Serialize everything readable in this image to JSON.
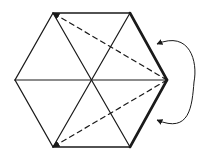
{
  "diagram": {
    "stroke_color": "#1a1a1a",
    "background": "#ffffff",
    "center": {
      "x": 91,
      "y": 80
    },
    "vertices": {
      "top_left": {
        "x": 53,
        "y": 13
      },
      "top_right": {
        "x": 130,
        "y": 13
      },
      "right": {
        "x": 167,
        "y": 80
      },
      "bottom_right": {
        "x": 130,
        "y": 147
      },
      "bottom_left": {
        "x": 53,
        "y": 147
      },
      "left": {
        "x": 15,
        "y": 80
      }
    },
    "edges": [
      {
        "from": "top_left",
        "to": "top_right",
        "style": "solid"
      },
      {
        "from": "top_right",
        "to": "right",
        "style": "bold"
      },
      {
        "from": "right",
        "to": "bottom_right",
        "style": "bold"
      },
      {
        "from": "bottom_right",
        "to": "bottom_left",
        "style": "solid"
      },
      {
        "from": "bottom_left",
        "to": "left",
        "style": "solid"
      },
      {
        "from": "left",
        "to": "top_left",
        "style": "solid"
      }
    ],
    "spokes": [
      {
        "from": "top_left",
        "to": "bottom_right"
      },
      {
        "from": "top_right",
        "to": "bottom_left"
      },
      {
        "from": "left",
        "to": "right"
      }
    ],
    "dashed_arrows": [
      {
        "from": "right",
        "to": "top_left",
        "arrowhead": "end"
      },
      {
        "from": "right",
        "to": "bottom_left",
        "arrowhead": "end"
      }
    ],
    "curved_arrow": {
      "start": {
        "x": 157,
        "y": 44
      },
      "end": {
        "x": 157,
        "y": 120
      },
      "bulge_x": 194,
      "arrowheads": "both"
    }
  }
}
